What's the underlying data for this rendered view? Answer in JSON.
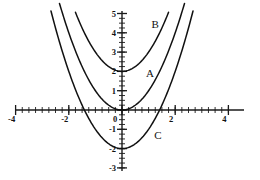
{
  "chart_data": {
    "type": "line",
    "title": "",
    "subtitle": "",
    "xlabel": "",
    "ylabel": "",
    "xlim": [
      -4,
      4
    ],
    "ylim": [
      -3,
      5
    ],
    "grid": false,
    "legend_position": "inline-annotations",
    "x_ticks": [
      -4,
      -2,
      0,
      2,
      4
    ],
    "x_tick_labels": [
      "-4",
      "-2",
      "0",
      "2",
      "4"
    ],
    "y_ticks": [
      -3,
      -2,
      -1,
      0,
      1,
      2,
      3,
      4,
      5
    ],
    "y_tick_labels": [
      "-3",
      "-2",
      "-1",
      "0",
      "1",
      "2",
      "3",
      "4",
      "5"
    ],
    "minor_tick_step": 0.25,
    "series": [
      {
        "name": "A",
        "label": "A",
        "equation": "y = x^2",
        "vertex": [
          0,
          0
        ],
        "color": "#111111",
        "x": [
          -2.35,
          -2.0,
          -1.75,
          -1.5,
          -1.25,
          -1.0,
          -0.75,
          -0.5,
          -0.25,
          0,
          0.25,
          0.5,
          0.75,
          1.0,
          1.25,
          1.5,
          1.75,
          2.0,
          2.35
        ],
        "values": [
          5.52,
          4.0,
          3.06,
          2.25,
          1.56,
          1.0,
          0.56,
          0.25,
          0.06,
          0,
          0.06,
          0.25,
          0.56,
          1.0,
          1.56,
          2.25,
          3.06,
          4.0,
          5.52
        ]
      },
      {
        "name": "B",
        "label": "B",
        "equation": "y = x^2 + 2",
        "vertex": [
          0,
          2
        ],
        "color": "#111111",
        "x": [
          -1.75,
          -1.5,
          -1.25,
          -1.0,
          -0.75,
          -0.5,
          -0.25,
          0,
          0.25,
          0.5,
          0.75,
          1.0,
          1.25,
          1.5,
          1.75
        ],
        "values": [
          5.06,
          4.25,
          3.56,
          3.0,
          2.56,
          2.25,
          2.06,
          2.0,
          2.06,
          2.25,
          2.56,
          3.0,
          3.56,
          4.25,
          5.06
        ]
      },
      {
        "name": "C",
        "label": "C",
        "equation": "y = x^2 - 2",
        "vertex": [
          0,
          -2
        ],
        "color": "#111111",
        "x": [
          -2.67,
          -2.5,
          -2.25,
          -2.0,
          -1.75,
          -1.5,
          -1.25,
          -1.0,
          -0.75,
          -0.5,
          -0.25,
          0,
          0.25,
          0.5,
          0.75,
          1.0,
          1.25,
          1.5,
          1.75,
          2.0,
          2.25,
          2.5,
          2.67
        ],
        "values": [
          5.11,
          4.25,
          3.06,
          2.0,
          1.06,
          0.25,
          -0.44,
          -1.0,
          -1.44,
          -1.75,
          -1.94,
          -2.0,
          -1.94,
          -1.75,
          -1.44,
          -1.0,
          -0.44,
          0.25,
          1.06,
          2.0,
          3.06,
          4.25,
          5.11
        ]
      }
    ],
    "annotations": [
      {
        "text": "B",
        "x": 1.25,
        "y": 4.25
      },
      {
        "text": "A",
        "x": 1.05,
        "y": 1.72
      },
      {
        "text": "C",
        "x": 1.35,
        "y": -1.5
      }
    ]
  },
  "figure": {
    "background_color": "#ffffff",
    "axis_color": "#1a1a1a",
    "curve_color": "#111111"
  }
}
